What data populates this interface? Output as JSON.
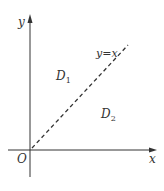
{
  "diagram": {
    "axes": {
      "x_label": "x",
      "y_label": "y",
      "origin_label": "O"
    },
    "line": {
      "label": "y=x",
      "style": "dashed"
    },
    "regions": [
      {
        "name": "D",
        "sub": "1"
      },
      {
        "name": "D",
        "sub": "2"
      }
    ],
    "colors": {
      "stroke": "#333333",
      "background": "#ffffff"
    }
  }
}
